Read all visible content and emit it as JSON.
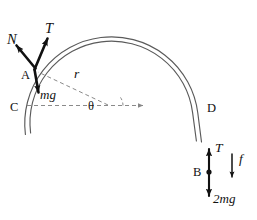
{
  "figure": {
    "type": "physics-force-diagram",
    "background_color": "#ffffff",
    "stroke_color": "#111111",
    "arc_color": "#555555",
    "dash_color": "#888888"
  },
  "labels": {
    "normal_force": "N",
    "tension_top": "T",
    "point_a": "A",
    "weight_mg": "mg",
    "point_c": "C",
    "radius": "r",
    "angle": "θ",
    "point_d": "D",
    "tension_bottom": "T",
    "point_b": "B",
    "weight_2mg": "2mg",
    "friction": "f"
  },
  "geometry": {
    "center": {
      "x": 108,
      "y": 105
    },
    "radius_outer": 86,
    "radius_inner": 81,
    "point_a": {
      "x": 34,
      "y": 70
    },
    "point_b": {
      "x": 209,
      "y": 172
    },
    "point_d": {
      "x": 200,
      "y": 108
    },
    "theta_degrees": 25
  },
  "vectors": [
    {
      "name": "N",
      "from": "A",
      "direction": "up-left",
      "magnitude_label": "N"
    },
    {
      "name": "T",
      "from": "A",
      "direction": "up-right-tangent",
      "magnitude_label": "T"
    },
    {
      "name": "mg",
      "from": "A",
      "direction": "down",
      "magnitude_label": "mg"
    },
    {
      "name": "T",
      "from": "B",
      "direction": "up",
      "magnitude_label": "T"
    },
    {
      "name": "2mg",
      "from": "B",
      "direction": "down",
      "magnitude_label": "2mg"
    },
    {
      "name": "f",
      "from": "free",
      "direction": "down",
      "magnitude_label": "f"
    }
  ]
}
